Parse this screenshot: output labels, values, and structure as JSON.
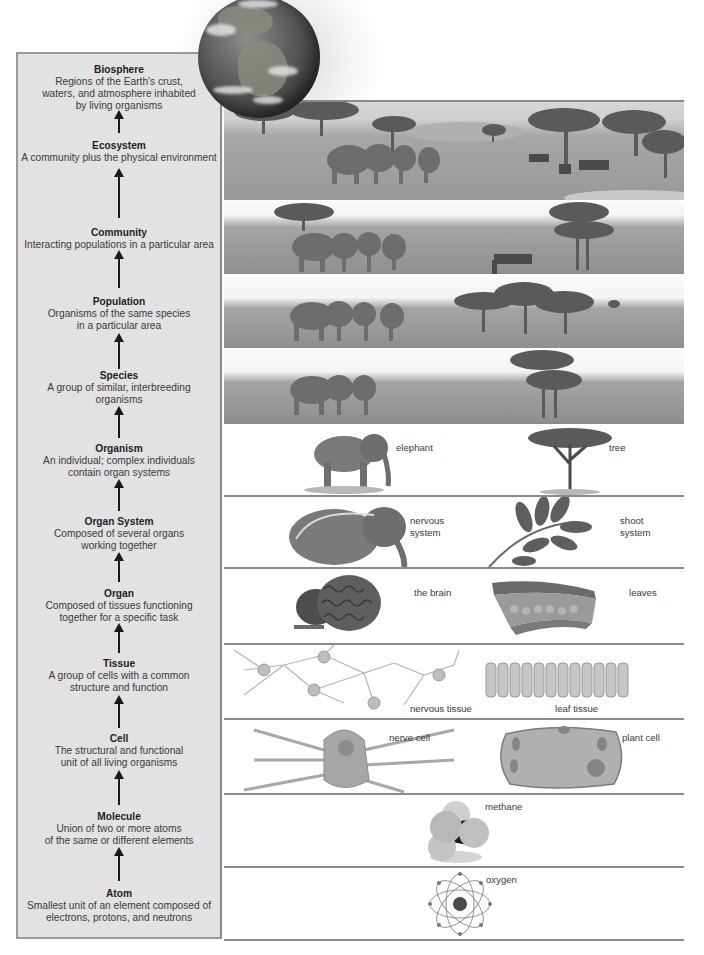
{
  "diagram": {
    "panel_bg": "#e2e2e2",
    "levels": [
      {
        "title": "Biosphere",
        "desc": "Regions of the Earth's crust,\nwaters, and atmosphere inhabited\nby living organisms"
      },
      {
        "title": "Ecosystem",
        "desc": "A community plus the physical environment"
      },
      {
        "title": "Community",
        "desc": "Interacting populations in a particular area"
      },
      {
        "title": "Population",
        "desc": "Organisms of the same species\nin a particular area"
      },
      {
        "title": "Species",
        "desc": "A group of similar, interbreeding\norganisms"
      },
      {
        "title": "Organism",
        "desc": "An individual; complex individuals\ncontain organ systems"
      },
      {
        "title": "Organ System",
        "desc": "Composed of several organs\nworking together"
      },
      {
        "title": "Organ",
        "desc": "Composed of tissues functioning\ntogether for a specific task"
      },
      {
        "title": "Tissue",
        "desc": "A group of cells with a common\nstructure and function"
      },
      {
        "title": "Cell",
        "desc": "The structural and functional\nunit of all living organisms"
      },
      {
        "title": "Molecule",
        "desc": "Union of two or more atoms\nof the same or different elements"
      },
      {
        "title": "Atom",
        "desc": "Smallest unit of an element composed of\nelectrons, protons, and neutrons"
      }
    ],
    "illustrations": {
      "biosphere": "earth-globe",
      "ecosystem": "savanna-elephants-zebras-waterhole",
      "community": "savanna-elephants-zebras-trees",
      "population": "elephant-herd-acacia-trees",
      "species": "elephants-acacia-tree",
      "organism": {
        "left": "elephant",
        "right": "tree"
      },
      "organ_system": {
        "left": "nervous\nsystem",
        "right": "shoot\nsystem"
      },
      "organ": {
        "left": "the brain",
        "right": "leaves"
      },
      "tissue": {
        "left": "nervous tissue",
        "right": "leaf tissue"
      },
      "cell": {
        "left": "nerve cell",
        "right": "plant cell"
      },
      "molecule": {
        "center": "methane"
      },
      "atom": {
        "center": "oxygen"
      }
    }
  }
}
